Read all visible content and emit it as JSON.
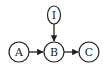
{
  "diagram": {
    "type": "directed-graph",
    "nodes": [
      {
        "id": "I",
        "label": "I"
      },
      {
        "id": "A",
        "label": "A"
      },
      {
        "id": "B",
        "label": "B"
      },
      {
        "id": "C",
        "label": "C"
      }
    ],
    "edges": [
      {
        "from": "A",
        "to": "B"
      },
      {
        "from": "B",
        "to": "C"
      },
      {
        "from": "I",
        "to": "B"
      }
    ]
  },
  "colors": {
    "stroke": "#222222",
    "background": "#ffffff"
  }
}
